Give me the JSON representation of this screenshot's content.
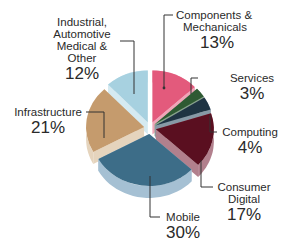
{
  "chart_data": {
    "type": "pie",
    "style": "3d-exploded",
    "title": "",
    "slices": [
      {
        "label": "Components & Mechanicals",
        "value": 13,
        "color": "#e35a7c",
        "side": "#f0a5b8"
      },
      {
        "label": "Services",
        "value": 3,
        "color": "#2f5a33",
        "side": "#8aa48c"
      },
      {
        "label": "Computing",
        "value": 4,
        "color": "#1f3443",
        "side": "#8799a6"
      },
      {
        "label": "Consumer Digital",
        "value": 17,
        "color": "#5a0f20",
        "side": "#b2808d"
      },
      {
        "label": "Mobile",
        "value": 30,
        "color": "#3d6d88",
        "side": "#a5c0d3"
      },
      {
        "label": "Infrastructure",
        "value": 21,
        "color": "#c59b6d",
        "side": "#e5d4bd"
      },
      {
        "label": "Industrial, Automotive Medical & Other",
        "value": 12,
        "color": "#a7d1e0",
        "side": "#d5eaf1"
      }
    ],
    "legend": "callout labels with leader lines"
  },
  "labels": {
    "components": {
      "name_l1": "Components &",
      "name_l2": "Mechanicals",
      "pct": "13%"
    },
    "services": {
      "name": "Services",
      "pct": "3%"
    },
    "computing": {
      "name": "Computing",
      "pct": "4%"
    },
    "consumer": {
      "name_l1": "Consumer",
      "name_l2": "Digital",
      "pct": "17%"
    },
    "mobile": {
      "name": "Mobile",
      "pct": "30%"
    },
    "infrastructure": {
      "name": "Infrastructure",
      "pct": "21%"
    },
    "industrial": {
      "name_l1": "Industrial,",
      "name_l2": "Automotive",
      "name_l3": "Medical &",
      "name_l4": "Other",
      "pct": "12%"
    }
  }
}
